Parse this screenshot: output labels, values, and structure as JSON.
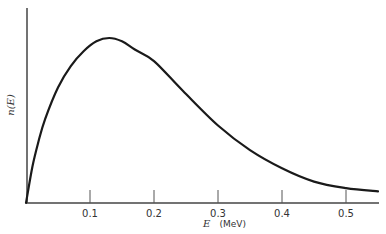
{
  "chart_data": {
    "type": "line",
    "title": "",
    "xlabel": "E (MeV)",
    "ylabel": "n(E)",
    "xlim": [
      0,
      0.55
    ],
    "ylim": [
      0,
      1.0
    ],
    "grid": false,
    "legend": null,
    "x_ticks": [
      "0.1",
      "0.2",
      "0.3",
      "0.4",
      "0.5"
    ],
    "x_tick_values": [
      0.1,
      0.2,
      0.3,
      0.4,
      0.5
    ],
    "y_ticks": [],
    "series": [
      {
        "name": "n(E)",
        "x": [
          0.0,
          0.01,
          0.02,
          0.03,
          0.05,
          0.07,
          0.09,
          0.11,
          0.13,
          0.15,
          0.17,
          0.2,
          0.245,
          0.3,
          0.35,
          0.4,
          0.45,
          0.5,
          0.55
        ],
        "values": [
          0.0,
          0.22,
          0.38,
          0.51,
          0.7,
          0.83,
          0.92,
          0.98,
          1.0,
          0.98,
          0.93,
          0.86,
          0.68,
          0.47,
          0.32,
          0.21,
          0.13,
          0.09,
          0.07
        ]
      }
    ],
    "annotations": [],
    "style": {
      "line_color": "#1a1a1a",
      "axis_color": "#444444",
      "background": "#ffffff"
    }
  },
  "labels": {
    "y_axis": "n(E)",
    "x_axis_var": "E",
    "x_axis_unit": "(MeV)"
  }
}
